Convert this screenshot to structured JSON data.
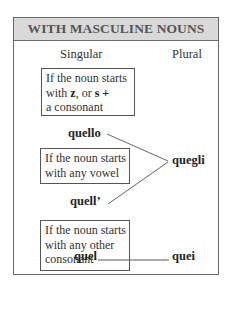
{
  "title": "WITH MASCULINE NOUNS",
  "columns": {
    "singular": "Singular",
    "plural": "Plural"
  },
  "rules": [
    {
      "condition_parts": [
        "If the noun starts",
        "with ",
        "z",
        ", or ",
        "s",
        " +",
        "a consonant"
      ],
      "singular": "quello",
      "plural": "quegli"
    },
    {
      "condition_lines": [
        "If the noun starts",
        "with any vowel"
      ],
      "singular": "quell’",
      "plural": "quegli"
    },
    {
      "condition_lines": [
        "If the noun starts",
        "with any other",
        "consonant"
      ],
      "singular": "quel",
      "plural": "quei"
    }
  ],
  "connector": "____________",
  "colors": {
    "header_bg": "#d9d9d9",
    "border": "#6a6a6a",
    "text": "#222222"
  }
}
